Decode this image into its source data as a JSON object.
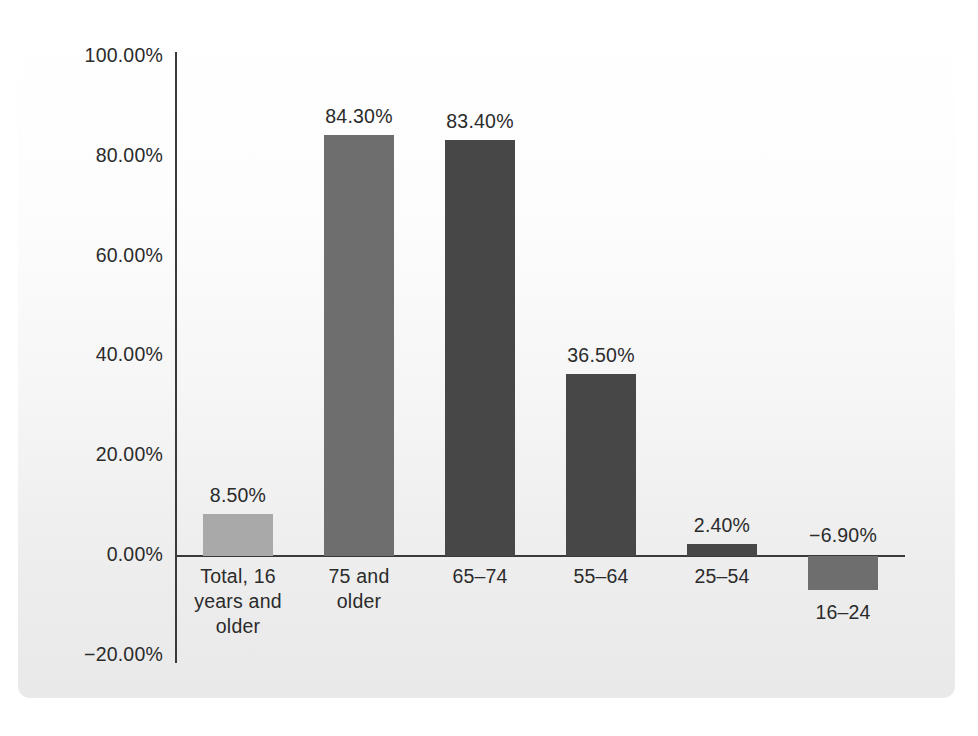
{
  "chart_data": {
    "type": "bar",
    "title": "",
    "subtitle": "",
    "xlabel": "",
    "ylabel": "",
    "ylim": [
      -20,
      100
    ],
    "grid": false,
    "legend": "none",
    "y_tick_labels": [
      "100.00%",
      "80.00%",
      "60.00%",
      "40.00%",
      "20.00%",
      "0.00%",
      "−20.00%"
    ],
    "y_tick_values": [
      100,
      80,
      60,
      40,
      20,
      0,
      -20
    ],
    "categories": [
      "Total, 16\nyears and\nolder",
      "75 and\nolder",
      "65–74",
      "55–64",
      "25–54",
      "16–24"
    ],
    "values": [
      8.5,
      84.3,
      83.4,
      36.5,
      2.4,
      -6.9
    ],
    "value_labels": [
      "8.50%",
      "84.30%",
      "83.40%",
      "36.50%",
      "2.40%",
      "−6.90%"
    ],
    "bar_colors": [
      "#a9a9a9",
      "#6e6e6e",
      "#474747",
      "#474747",
      "#474747",
      "#6e6e6e"
    ],
    "bars": [
      {
        "category": "Total, 16\nyears and\nolder",
        "value": 8.5,
        "label": "8.50%",
        "color": "#a9a9a9",
        "x": 203,
        "width": 70
      },
      {
        "category": "75 and\nolder",
        "value": 84.3,
        "label": "84.30%",
        "color": "#6e6e6e",
        "x": 324,
        "width": 70
      },
      {
        "category": "65–74",
        "value": 83.4,
        "label": "83.40%",
        "color": "#474747",
        "x": 445,
        "width": 70
      },
      {
        "category": "55–64",
        "value": 36.5,
        "label": "36.50%",
        "color": "#474747",
        "x": 566,
        "width": 70
      },
      {
        "category": "25–54",
        "value": 2.4,
        "label": "2.40%",
        "color": "#474747",
        "x": 687,
        "width": 70
      },
      {
        "category": "16–24",
        "value": -6.9,
        "label": "−6.90%",
        "color": "#6e6e6e",
        "x": 808,
        "width": 70
      }
    ]
  },
  "colors": {
    "axis": "#3a3a3a",
    "text": "#2b2b2b",
    "panel_top": "#ffffff",
    "panel_bottom": "#e9e9e9"
  }
}
